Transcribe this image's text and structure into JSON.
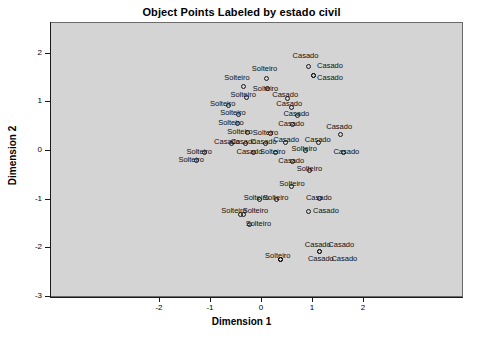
{
  "chart_data": {
    "type": "scatter",
    "title": "Object Points Labeled by estado civil",
    "xlabel": "Dimension 1",
    "ylabel": "Dimension 2",
    "xlim": [
      -2.75,
      2.9
    ],
    "ylim": [
      -3.0,
      2.45
    ],
    "xticks": [
      "-2",
      "-1",
      "0",
      "1",
      "2"
    ],
    "xtick_values": [
      -2,
      -1,
      0,
      1,
      2
    ],
    "yticks": [
      "2",
      "1",
      "0",
      "-1",
      "-2",
      "-3"
    ],
    "ytick_values": [
      2,
      1,
      0,
      -1,
      -2,
      -3
    ],
    "grid": false,
    "legend": null,
    "marker": "open-circle",
    "categories": [
      "Casado",
      "Solteiro"
    ],
    "points": [
      {
        "x": 0.93,
        "y": 1.72,
        "label": "Casado",
        "lx": 0.62,
        "ly": 1.93
      },
      {
        "x": 1.02,
        "y": 1.52,
        "label": "Casado",
        "lx": 1.1,
        "ly": 1.72
      },
      {
        "x": 1.02,
        "y": 1.52,
        "label": "Casado",
        "lx": 1.1,
        "ly": 1.48
      },
      {
        "x": 0.1,
        "y": 1.46,
        "label": "Solteiro",
        "lx": -0.18,
        "ly": 1.66
      },
      {
        "x": -0.35,
        "y": 1.3,
        "label": "Solteiro",
        "lx": -0.72,
        "ly": 1.47
      },
      {
        "x": 0.13,
        "y": 1.26,
        "label": "Solteiro",
        "lx": -0.16,
        "ly": 1.26
      },
      {
        "x": -0.28,
        "y": 1.08,
        "label": "Solteiro",
        "lx": -0.6,
        "ly": 1.12
      },
      {
        "x": 0.52,
        "y": 1.06,
        "label": "Casado",
        "lx": 0.22,
        "ly": 1.12
      },
      {
        "x": -0.63,
        "y": 0.92,
        "label": "Solteiro",
        "lx": -1.0,
        "ly": 0.94
      },
      {
        "x": 0.6,
        "y": 0.88,
        "label": "Casado",
        "lx": 0.3,
        "ly": 0.94
      },
      {
        "x": -0.44,
        "y": 0.72,
        "label": "Solteiro",
        "lx": -0.8,
        "ly": 0.75
      },
      {
        "x": 0.72,
        "y": 0.7,
        "label": "Casado",
        "lx": 0.44,
        "ly": 0.74
      },
      {
        "x": -0.46,
        "y": 0.55,
        "label": "Solteiro",
        "lx": -0.84,
        "ly": 0.56
      },
      {
        "x": 0.62,
        "y": 0.52,
        "label": "Casado",
        "lx": 0.34,
        "ly": 0.54
      },
      {
        "x": -0.26,
        "y": 0.36,
        "label": "Solteiro",
        "lx": -0.66,
        "ly": 0.36
      },
      {
        "x": 0.18,
        "y": 0.34,
        "label": "Solteiro",
        "lx": -0.16,
        "ly": 0.34
      },
      {
        "x": 1.55,
        "y": 0.32,
        "label": "Casado",
        "lx": 1.28,
        "ly": 0.48
      },
      {
        "x": -0.58,
        "y": 0.14,
        "label": "Casado",
        "lx": -0.92,
        "ly": 0.17
      },
      {
        "x": -0.3,
        "y": 0.14,
        "label": "Casado",
        "lx": -0.6,
        "ly": 0.17
      },
      {
        "x": 0.08,
        "y": 0.14,
        "label": "Casado",
        "lx": -0.2,
        "ly": 0.17
      },
      {
        "x": 0.48,
        "y": 0.16,
        "label": "Casado",
        "lx": 0.24,
        "ly": 0.2
      },
      {
        "x": 1.12,
        "y": 0.16,
        "label": "Casado",
        "lx": 0.86,
        "ly": 0.2
      },
      {
        "x": 0.88,
        "y": -0.02,
        "label": "Solteiro",
        "lx": 0.6,
        "ly": 0.02
      },
      {
        "x": -1.1,
        "y": -0.06,
        "label": "Solteiro",
        "lx": -1.46,
        "ly": -0.04
      },
      {
        "x": -0.14,
        "y": -0.06,
        "label": "Casado",
        "lx": -0.48,
        "ly": -0.04
      },
      {
        "x": 0.28,
        "y": -0.06,
        "label": "Solteiro",
        "lx": -0.02,
        "ly": -0.04
      },
      {
        "x": 1.62,
        "y": -0.06,
        "label": "Casado",
        "lx": 1.42,
        "ly": -0.04
      },
      {
        "x": -1.26,
        "y": -0.22,
        "label": "Solteiro",
        "lx": -1.62,
        "ly": -0.2
      },
      {
        "x": 0.62,
        "y": -0.24,
        "label": "Casado",
        "lx": 0.34,
        "ly": -0.22
      },
      {
        "x": 0.96,
        "y": -0.42,
        "label": "Solteiro",
        "lx": 0.7,
        "ly": -0.38
      },
      {
        "x": 0.6,
        "y": -0.74,
        "label": "Solteiro",
        "lx": 0.36,
        "ly": -0.7
      },
      {
        "x": -0.02,
        "y": -1.02,
        "label": "Solteiro",
        "lx": -0.34,
        "ly": -0.98
      },
      {
        "x": 1.14,
        "y": -1.0,
        "label": "Casado",
        "lx": 0.88,
        "ly": -0.98
      },
      {
        "x": 0.3,
        "y": -1.02,
        "label": "Solteiro",
        "lx": 0.04,
        "ly": -0.98
      },
      {
        "x": -0.4,
        "y": -1.32,
        "label": "Solteiro",
        "lx": -0.78,
        "ly": -1.26
      },
      {
        "x": 0.94,
        "y": -1.26,
        "label": "Casado",
        "lx": 1.02,
        "ly": -1.26
      },
      {
        "x": -0.34,
        "y": -1.32,
        "label": "Solteiro",
        "lx": -0.36,
        "ly": -1.26
      },
      {
        "x": -0.22,
        "y": -1.52,
        "label": "Solteiro",
        "lx": -0.3,
        "ly": -1.52
      },
      {
        "x": 1.14,
        "y": -2.08,
        "label": "Casado",
        "lx": 0.86,
        "ly": -1.96
      },
      {
        "x": 1.14,
        "y": -2.08,
        "label": "Casado",
        "lx": 1.32,
        "ly": -1.96
      },
      {
        "x": 0.38,
        "y": -2.24,
        "label": "Solteiro",
        "lx": 0.08,
        "ly": -2.18
      },
      {
        "x": 0.38,
        "y": -2.24,
        "label": "Casado",
        "lx": 0.92,
        "ly": -2.24
      },
      {
        "x": 0.38,
        "y": -2.24,
        "label": "Casado",
        "lx": 1.38,
        "ly": -2.24
      }
    ]
  },
  "colors": {
    "plot_background": "#d4d4d4",
    "frame": "#6b6b6b",
    "text": "#000000",
    "marker": "#1a1a1a"
  }
}
